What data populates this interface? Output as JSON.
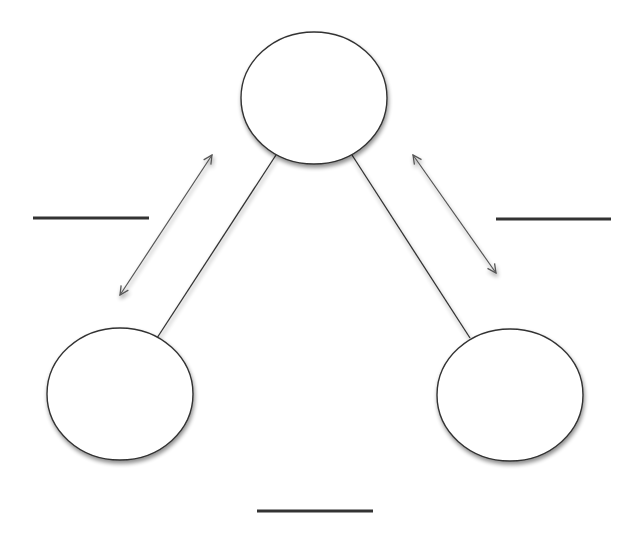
{
  "diagram": {
    "type": "triangle-relationship",
    "nodes": [
      {
        "id": "top",
        "label": "",
        "cx": 314,
        "cy": 98,
        "rx": 73,
        "ry": 66
      },
      {
        "id": "left",
        "label": "",
        "cx": 120,
        "cy": 394,
        "rx": 73,
        "ry": 66
      },
      {
        "id": "right",
        "label": "",
        "cx": 510,
        "cy": 395,
        "rx": 73,
        "ry": 66
      }
    ],
    "edges": [
      {
        "from": "top",
        "to": "left",
        "x1": 276,
        "y1": 155,
        "x2": 157,
        "y2": 338
      },
      {
        "from": "top",
        "to": "right",
        "x1": 352,
        "y1": 155,
        "x2": 470,
        "y2": 338
      },
      {
        "from": "left",
        "to": "right",
        "x1": 193,
        "y1": 396,
        "x2": 437,
        "y2": 396
      }
    ],
    "arrows": [
      {
        "id": "left-arrow",
        "x1": 212,
        "y1": 155,
        "x2": 120,
        "y2": 295
      },
      {
        "id": "right-arrow",
        "x1": 413,
        "y1": 155,
        "x2": 496,
        "y2": 273
      },
      {
        "id": "bottom-arrow",
        "x1": 205,
        "y1": 448,
        "x2": 413,
        "y2": 448
      }
    ],
    "blanks": [
      {
        "id": "left-blank",
        "value": "",
        "x1": 33,
        "y1": 218,
        "x2": 149,
        "y2": 218
      },
      {
        "id": "right-blank",
        "value": "",
        "x1": 496,
        "y1": 219,
        "x2": 611,
        "y2": 219
      },
      {
        "id": "bottom-blank",
        "value": "",
        "x1": 257,
        "y1": 511,
        "x2": 373,
        "y2": 511
      }
    ],
    "colors": {
      "stroke": "#333333",
      "fill": "#ffffff",
      "arrow": "#555555",
      "shadow": "#999999"
    }
  }
}
